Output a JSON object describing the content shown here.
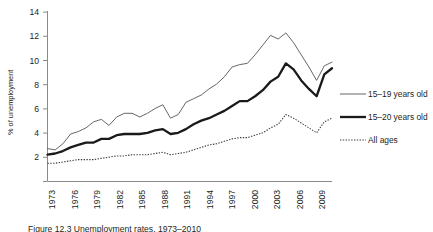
{
  "figure": {
    "caption": "Figure 12.3 Unemployment rates, 1973–2010"
  },
  "chart_data": {
    "type": "line",
    "title": "",
    "xlabel": "",
    "ylabel": "% of unemployment",
    "ylim": [
      0,
      14
    ],
    "yticks": [
      0,
      2,
      4,
      6,
      8,
      10,
      12,
      14
    ],
    "ytick_labels": [
      "0",
      "2",
      "4",
      "6",
      "8",
      "10",
      "12",
      "14"
    ],
    "xlim": [
      1973,
      2010
    ],
    "xticks": [
      1973,
      1976,
      1979,
      1982,
      1985,
      1988,
      1991,
      1994,
      1997,
      2000,
      2003,
      2006,
      2009
    ],
    "xtick_labels": [
      "1973",
      "1976",
      "1979",
      "1982",
      "1985",
      "1988",
      "1991",
      "1994",
      "1997",
      "2000",
      "2003",
      "2006",
      "2009"
    ],
    "xtick_rotation": 90,
    "grid": false,
    "legend_position": "right",
    "x": [
      1973,
      1974,
      1975,
      1976,
      1977,
      1978,
      1979,
      1980,
      1981,
      1982,
      1983,
      1984,
      1985,
      1986,
      1987,
      1988,
      1989,
      1990,
      1991,
      1992,
      1993,
      1994,
      1995,
      1996,
      1997,
      1998,
      1999,
      2000,
      2001,
      2002,
      2003,
      2004,
      2005,
      2006,
      2007,
      2008,
      2009,
      2010
    ],
    "series": [
      {
        "name": "15–19 years old",
        "style": "thin-solid",
        "color": "#555555",
        "values": [
          2.7,
          2.6,
          3.1,
          3.9,
          4.1,
          4.4,
          4.9,
          5.1,
          4.6,
          5.3,
          5.6,
          5.6,
          5.3,
          5.6,
          6.0,
          6.3,
          5.2,
          5.5,
          6.5,
          6.8,
          7.1,
          7.6,
          8.0,
          8.6,
          9.4,
          9.6,
          9.7,
          10.4,
          11.2,
          12.0,
          11.7,
          12.2,
          11.4,
          10.4,
          9.4,
          8.3,
          9.5,
          9.8
        ]
      },
      {
        "name": "15–20 years old",
        "style": "thick-solid",
        "color": "#1a1a1a",
        "values": [
          2.2,
          2.3,
          2.5,
          2.8,
          3.0,
          3.2,
          3.2,
          3.5,
          3.5,
          3.8,
          3.9,
          3.9,
          3.9,
          4.0,
          4.2,
          4.3,
          3.9,
          4.0,
          4.3,
          4.7,
          5.0,
          5.2,
          5.5,
          5.8,
          6.2,
          6.6,
          6.6,
          7.0,
          7.5,
          8.2,
          8.6,
          9.7,
          9.2,
          8.3,
          7.6,
          7.0,
          8.8,
          9.3
        ]
      },
      {
        "name": "All ages",
        "style": "dotted",
        "color": "#3a3a3a",
        "values": [
          1.5,
          1.5,
          1.6,
          1.7,
          1.8,
          1.8,
          1.8,
          1.9,
          2.0,
          2.1,
          2.1,
          2.2,
          2.2,
          2.2,
          2.3,
          2.4,
          2.2,
          2.3,
          2.4,
          2.6,
          2.8,
          3.0,
          3.1,
          3.3,
          3.5,
          3.6,
          3.6,
          3.8,
          4.0,
          4.4,
          4.7,
          5.5,
          5.2,
          4.8,
          4.4,
          4.0,
          4.9,
          5.2
        ]
      }
    ],
    "legend": [
      {
        "label": "15–19 years old",
        "style": "thin-solid"
      },
      {
        "label": "15–20 years old",
        "style": "thick-solid"
      },
      {
        "label": "All ages",
        "style": "dotted"
      }
    ]
  }
}
